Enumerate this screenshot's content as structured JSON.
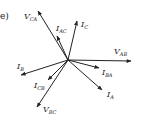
{
  "diagram": {
    "panel_label": "e)",
    "type": "phasor-diagram",
    "origin": [
      68,
      60
    ],
    "color": "#222222",
    "phasors": [
      {
        "name": "V",
        "sub": "CA",
        "tip": [
          38,
          11
        ],
        "label_pos": [
          24,
          19
        ],
        "kind": "voltage"
      },
      {
        "name": "I",
        "sub": "AC",
        "tip": [
          57,
          36
        ],
        "label_pos": [
          56,
          31
        ],
        "kind": "current"
      },
      {
        "name": "I",
        "sub": "C",
        "tip": [
          77,
          21
        ],
        "label_pos": [
          81,
          27
        ],
        "kind": "current"
      },
      {
        "name": "V",
        "sub": "AB",
        "tip": [
          131,
          61
        ],
        "label_pos": [
          114,
          54
        ],
        "kind": "voltage"
      },
      {
        "name": "I",
        "sub": "BA",
        "tip": [
          99,
          68
        ],
        "label_pos": [
          102,
          75
        ],
        "kind": "current"
      },
      {
        "name": "I",
        "sub": "A",
        "tip": [
          102,
          90
        ],
        "label_pos": [
          107,
          97
        ],
        "kind": "current"
      },
      {
        "name": "V",
        "sub": "BC",
        "tip": [
          37,
          107
        ],
        "label_pos": [
          43,
          112
        ],
        "kind": "voltage"
      },
      {
        "name": "I",
        "sub": "CB",
        "tip": [
          48,
          80
        ],
        "label_pos": [
          34,
          88
        ],
        "kind": "current"
      },
      {
        "name": "I",
        "sub": "B",
        "tip": [
          21,
          75
        ],
        "label_pos": [
          17,
          69
        ],
        "kind": "current"
      }
    ]
  }
}
